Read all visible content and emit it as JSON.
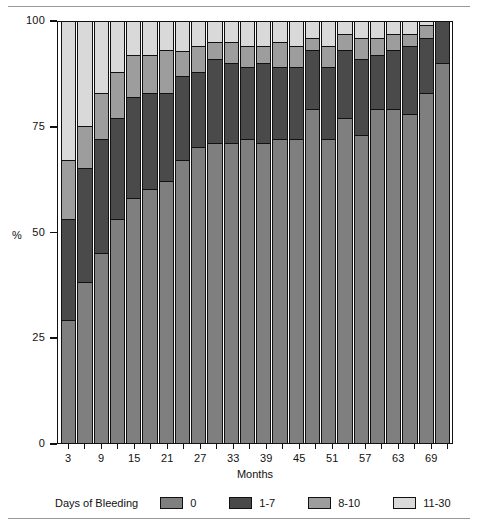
{
  "chart_data": {
    "type": "bar",
    "subtype": "stacked-bar-100-percent",
    "title": "",
    "xlabel": "Months",
    "ylabel": "%",
    "ylim": [
      0,
      100
    ],
    "yticks": [
      0,
      25,
      50,
      75,
      100
    ],
    "ytick_labels": [
      "0",
      "25",
      "50",
      "75",
      "100"
    ],
    "grid": false,
    "legend_title": "Days of Bleeding",
    "legend_position": "bottom",
    "categories": [
      3,
      6,
      9,
      12,
      15,
      18,
      21,
      24,
      27,
      30,
      33,
      36,
      39,
      42,
      45,
      48,
      51,
      54,
      57,
      60,
      63,
      66,
      69,
      72
    ],
    "xtick_labels": [
      "3",
      "9",
      "15",
      "21",
      "27",
      "33",
      "39",
      "45",
      "51",
      "57",
      "63",
      "69"
    ],
    "xtick_categories": [
      3,
      9,
      15,
      21,
      27,
      33,
      39,
      45,
      51,
      57,
      63,
      69
    ],
    "series": [
      {
        "name": "0",
        "color": "#7f7f7f",
        "values": [
          29,
          38,
          45,
          53,
          58,
          60,
          62,
          67,
          70,
          71,
          71,
          72,
          71,
          72,
          72,
          79,
          72,
          77,
          73,
          79,
          79,
          78,
          83,
          90
        ]
      },
      {
        "name": "1-7",
        "color": "#4a4a4a",
        "values": [
          24,
          27,
          27,
          24,
          24,
          23,
          21,
          20,
          18,
          20,
          19,
          17,
          19,
          17,
          17,
          14,
          17,
          16,
          18,
          13,
          14,
          16,
          13,
          10
        ]
      },
      {
        "name": "8-10",
        "color": "#9d9d9d",
        "values": [
          14,
          10,
          11,
          11,
          10,
          9,
          10,
          6,
          6,
          4,
          5,
          5,
          4,
          6,
          5,
          3,
          5,
          4,
          5,
          4,
          4,
          3,
          3,
          0
        ]
      },
      {
        "name": "11-30",
        "color": "#d9d9d9",
        "values": [
          33,
          25,
          17,
          12,
          8,
          8,
          7,
          7,
          6,
          5,
          5,
          6,
          6,
          5,
          6,
          4,
          6,
          3,
          4,
          4,
          3,
          3,
          1,
          0
        ]
      }
    ]
  },
  "legend": {
    "title": "Days of Bleeding",
    "items": [
      {
        "label": "0",
        "color": "#7f7f7f"
      },
      {
        "label": "1-7",
        "color": "#4a4a4a"
      },
      {
        "label": "8-10",
        "color": "#9d9d9d"
      },
      {
        "label": "11-30",
        "color": "#d9d9d9"
      }
    ]
  },
  "axes": {
    "y_title": "%",
    "x_title": "Months"
  }
}
